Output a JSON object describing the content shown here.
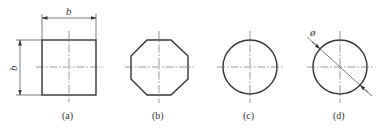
{
  "figures": [
    {
      "id": "a",
      "label": "(a)",
      "shape": "square",
      "dimension_horizontal": "b",
      "dimension_vertical": "b"
    },
    {
      "id": "b",
      "label": "(b)",
      "shape": "octagon"
    },
    {
      "id": "c",
      "label": "(c)",
      "shape": "circle"
    },
    {
      "id": "d",
      "label": "(d)",
      "shape": "circle",
      "dimension_diameter": "ø"
    }
  ],
  "colors": {
    "line": "#333333",
    "background": "#ffffff"
  }
}
